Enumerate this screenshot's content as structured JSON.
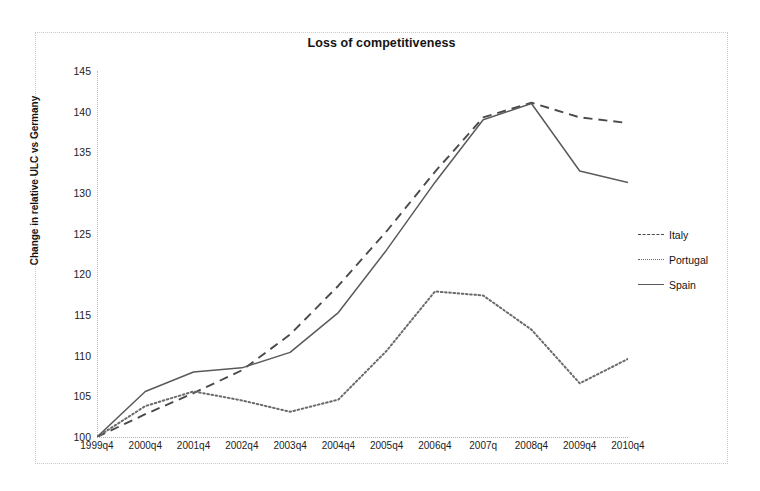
{
  "chart_data": {
    "type": "line",
    "title": "Loss of competitiveness",
    "xlabel": "",
    "ylabel": "Change in relative ULC vs Germany",
    "categories": [
      "1999q4",
      "2000q4",
      "2001q4",
      "2002q4",
      "2003q4",
      "2004q4",
      "2005q4",
      "2006q4",
      "2007q",
      "2008q4",
      "2009q4",
      "2010q4"
    ],
    "ylim": [
      100,
      145
    ],
    "yticks": [
      100,
      105,
      110,
      115,
      120,
      125,
      130,
      135,
      140,
      145
    ],
    "grid": false,
    "legend_position": "right",
    "series": [
      {
        "name": "Italy",
        "style": "dashed",
        "color": "#4a4a4a",
        "values": [
          100.0,
          102.8,
          105.4,
          108.2,
          112.6,
          118.6,
          125.3,
          132.6,
          139.3,
          141.1,
          139.3,
          138.6
        ]
      },
      {
        "name": "Portugal",
        "style": "dotted",
        "color": "#6b6b6b",
        "values": [
          100.0,
          103.8,
          105.6,
          104.5,
          103.1,
          104.6,
          110.6,
          117.9,
          117.4,
          113.2,
          106.6,
          109.6
        ]
      },
      {
        "name": "Spain",
        "style": "solid",
        "color": "#5a5a5a",
        "values": [
          100.0,
          105.6,
          108.0,
          108.5,
          110.4,
          115.3,
          123.0,
          131.3,
          139.0,
          141.0,
          132.7,
          131.3
        ]
      }
    ]
  },
  "axis": {
    "y_tick_labels": [
      "145",
      "140",
      "135",
      "130",
      "125",
      "120",
      "115",
      "110",
      "105",
      "100"
    ],
    "y_title": "Change in relative ULC vs Germany",
    "x_tick_labels": [
      "1999q4",
      "2000q4",
      "2001q4",
      "2002q4",
      "2003q4",
      "2004q4",
      "2005q4",
      "2006q4",
      "2007q",
      "2008q4",
      "2009q4",
      "2010q4"
    ]
  },
  "legend": {
    "items": [
      {
        "label": "Italy",
        "style": "dashed"
      },
      {
        "label": "Portugal",
        "style": "dotted"
      },
      {
        "label": "Spain",
        "style": "solid"
      }
    ]
  },
  "colors": {
    "italy": "#4a4a4a",
    "portugal": "#6b6b6b",
    "spain": "#5a5a5a",
    "border": "#c9c9c9",
    "background": "#ffffff",
    "text": "#141414"
  }
}
